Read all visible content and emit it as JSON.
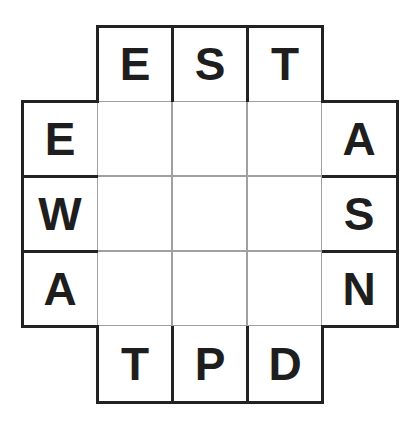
{
  "puzzle": {
    "grid_size": 3,
    "top_clues": [
      "E",
      "S",
      "T"
    ],
    "bottom_clues": [
      "T",
      "P",
      "D"
    ],
    "left_clues": [
      "E",
      "W",
      "A"
    ],
    "right_clues": [
      "A",
      "S",
      "N"
    ],
    "cells": [
      [
        "",
        "",
        ""
      ],
      [
        "",
        "",
        ""
      ],
      [
        "",
        "",
        ""
      ]
    ]
  },
  "colors": {
    "border": "#222222",
    "inner_line": "#a0a0a0",
    "text": "#1e1e1e",
    "background": "#ffffff"
  }
}
